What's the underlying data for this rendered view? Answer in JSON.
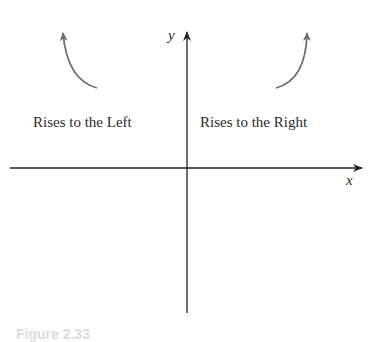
{
  "diagram": {
    "axes": {
      "x_label": "x",
      "y_label": "y"
    },
    "regions": [
      {
        "label": "Rises to the Left",
        "arrow": "curve-up-left"
      },
      {
        "label": "Rises to the Right",
        "arrow": "curve-up-right"
      }
    ],
    "caption": "Figure 2.33"
  },
  "colors": {
    "axis": "#222222",
    "arrow": "#6e6e6e",
    "text": "#2a2a2a"
  }
}
